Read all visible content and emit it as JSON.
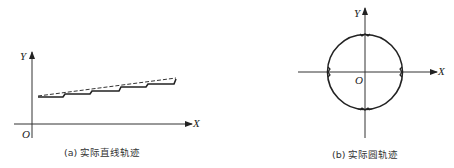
{
  "diagrams": [
    {
      "id": "a",
      "caption": "(a) 实际直线轨迹",
      "axis_labels": {
        "x": "X",
        "y": "Y",
        "origin": "O"
      },
      "description": "Staircase actual trajectory (solid) approximating a straight line (dashed)"
    },
    {
      "id": "b",
      "caption": "(b) 实际圆轨迹",
      "axis_labels": {
        "x": "X",
        "y": "Y",
        "origin": "O"
      },
      "description": "Actual circular trajectory centered at origin with small kinks at axis crossings"
    }
  ],
  "colors": {
    "line": "#222222",
    "background": "#ffffff"
  }
}
